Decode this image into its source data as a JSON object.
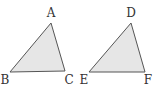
{
  "diagram": {
    "type": "geometry",
    "triangles": [
      {
        "name": "ABC",
        "fill": "#e6e6e6",
        "stroke": "#555555",
        "vertices": [
          {
            "label": "A",
            "x": 51,
            "y": 23,
            "lx": 51,
            "ly": 17
          },
          {
            "label": "B",
            "x": 10,
            "y": 72,
            "lx": 5,
            "ly": 84
          },
          {
            "label": "C",
            "x": 65,
            "y": 71,
            "lx": 69,
            "ly": 84
          }
        ]
      },
      {
        "name": "DEF",
        "fill": "#e6e6e6",
        "stroke": "#555555",
        "vertices": [
          {
            "label": "D",
            "x": 131,
            "y": 23,
            "lx": 131,
            "ly": 17
          },
          {
            "label": "E",
            "x": 89,
            "y": 72,
            "lx": 84,
            "ly": 84
          },
          {
            "label": "F",
            "x": 145,
            "y": 72,
            "lx": 148,
            "ly": 84
          }
        ]
      }
    ]
  }
}
